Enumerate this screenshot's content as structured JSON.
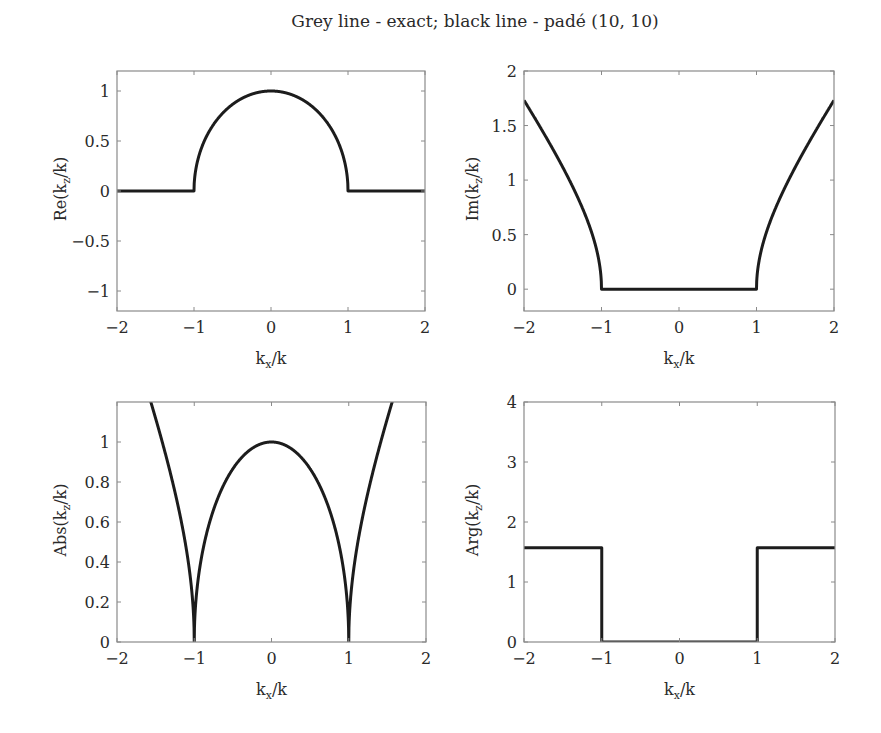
{
  "figure": {
    "title": "Grey line - exact; black line - padé (10, 10)"
  },
  "chart_data": [
    {
      "type": "line",
      "id": "re",
      "title": "",
      "xlabel": "k_x/k",
      "ylabel": "Re(k_z/k)",
      "xlim": [
        -2,
        2
      ],
      "ylim": [
        -1.2,
        1.2
      ],
      "xticks": [
        -2,
        -1,
        0,
        1,
        2
      ],
      "yticks": [
        -1,
        -0.5,
        0,
        0.5,
        1
      ],
      "xtick_labels": [
        "−2",
        "−1",
        "0",
        "1",
        "2"
      ],
      "ytick_labels": [
        "−1",
        "−0.5",
        "0",
        "0.5",
        "1"
      ],
      "grid": false,
      "legend": null,
      "function": "Re(sqrt(1 - x^2))",
      "series": [
        {
          "name": "exact (grey) / padé (10,10) (black) — overlapping",
          "x": [
            -2,
            -1.5,
            -1.0,
            -0.9,
            -0.5,
            0,
            0.5,
            0.9,
            1.0,
            1.5,
            2
          ],
          "values": [
            0,
            0,
            0,
            0.436,
            0.866,
            1.0,
            0.866,
            0.436,
            0,
            0,
            0
          ]
        }
      ]
    },
    {
      "type": "line",
      "id": "im",
      "title": "",
      "xlabel": "k_x/k",
      "ylabel": "Im(k_z/k)",
      "xlim": [
        -2,
        2
      ],
      "ylim": [
        -0.2,
        2
      ],
      "xticks": [
        -2,
        -1,
        0,
        1,
        2
      ],
      "yticks": [
        0,
        0.5,
        1,
        1.5,
        2
      ],
      "xtick_labels": [
        "−2",
        "−1",
        "0",
        "1",
        "2"
      ],
      "ytick_labels": [
        "0",
        "0.5",
        "1",
        "1.5",
        "2"
      ],
      "grid": false,
      "legend": null,
      "function": "Im(sqrt(1 - x^2))",
      "series": [
        {
          "name": "exact (grey) / padé (10,10) (black) — overlapping",
          "x": [
            -2,
            -1.5,
            -1.1,
            -1.0,
            0,
            1.0,
            1.1,
            1.5,
            2
          ],
          "values": [
            1.732,
            1.118,
            0.458,
            0,
            0,
            0,
            0.458,
            1.118,
            1.732
          ]
        }
      ]
    },
    {
      "type": "line",
      "id": "abs",
      "title": "",
      "xlabel": "k_x/k",
      "ylabel": "Abs(k_z/k)",
      "xlim": [
        -2,
        2
      ],
      "ylim": [
        0,
        1.2
      ],
      "xticks": [
        -2,
        -1,
        0,
        1,
        2
      ],
      "yticks": [
        0,
        0.2,
        0.4,
        0.6,
        0.8,
        1
      ],
      "xtick_labels": [
        "−2",
        "−1",
        "0",
        "1",
        "2"
      ],
      "ytick_labels": [
        "0",
        "0.2",
        "0.4",
        "0.6",
        "0.8",
        "1"
      ],
      "grid": false,
      "legend": null,
      "function": "|sqrt(1 - x^2)|",
      "series": [
        {
          "name": "exact (grey) / padé (10,10) (black) — overlapping",
          "x": [
            -1.56,
            -1.5,
            -1.2,
            -1.0,
            -0.8,
            -0.5,
            0,
            0.5,
            0.8,
            1.0,
            1.2,
            1.5,
            1.56
          ],
          "values": [
            1.2,
            1.118,
            0.663,
            0,
            0.6,
            0.866,
            1.0,
            0.866,
            0.6,
            0,
            0.663,
            1.118,
            1.2
          ]
        }
      ]
    },
    {
      "type": "line",
      "id": "arg",
      "title": "",
      "xlabel": "k_x/k",
      "ylabel": "Arg(k_z/k)",
      "xlim": [
        -2,
        2
      ],
      "ylim": [
        0,
        4
      ],
      "xticks": [
        -2,
        -1,
        0,
        1,
        2
      ],
      "yticks": [
        0,
        1,
        2,
        3,
        4
      ],
      "xtick_labels": [
        "−2",
        "−1",
        "0",
        "1",
        "2"
      ],
      "ytick_labels": [
        "0",
        "1",
        "2",
        "3",
        "4"
      ],
      "grid": false,
      "legend": null,
      "function": "arg(sqrt(1 - x^2))",
      "series": [
        {
          "name": "exact (grey) / padé (10,10) (black) — overlapping",
          "x": [
            -2,
            -1.0,
            -1.0,
            1.0,
            1.0,
            2
          ],
          "values": [
            1.571,
            1.571,
            0,
            0,
            1.571,
            1.571
          ]
        }
      ]
    }
  ]
}
